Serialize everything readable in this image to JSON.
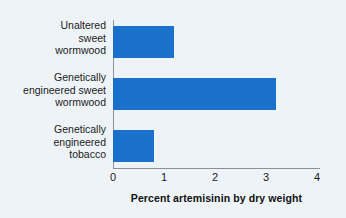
{
  "chart_data": {
    "type": "bar",
    "orientation": "horizontal",
    "title": "",
    "xlabel": "Percent artemisinin by dry weight",
    "ylabel": "",
    "categories": [
      "Unaltered\nsweet\nwormwood",
      "Genetically\nengineered sweet\nwormwood",
      "Genetically\nengineered\ntobacco"
    ],
    "values": [
      1.2,
      3.2,
      0.8
    ],
    "xlim": [
      0,
      4
    ],
    "xticks": [
      "0",
      "1",
      "2",
      "3",
      "4"
    ],
    "xtick_values": [
      0,
      1,
      2,
      3,
      4
    ],
    "grid": false,
    "legend": "none",
    "bar_color": "#1a71cc",
    "axis_color": "#8a9099",
    "background_color": "#eef3f8",
    "text_color": "#1b1b1b"
  }
}
